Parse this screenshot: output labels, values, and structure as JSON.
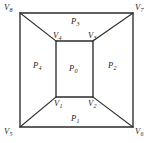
{
  "figure": {
    "type": "planar-graph-diagram",
    "stroke_color": "#2b2b2b",
    "text_color": "#1c1c1c",
    "background_color": "#ffffff",
    "vertices": [
      {
        "id": "v1",
        "base": "V",
        "sub": "1",
        "label": "V1",
        "ring": "inner",
        "corner": "bottom-left",
        "x": 56,
        "y": 97
      },
      {
        "id": "v2",
        "base": "V",
        "sub": "2",
        "label": "V2",
        "ring": "inner",
        "corner": "bottom-right",
        "x": 93,
        "y": 97
      },
      {
        "id": "v3",
        "base": "V",
        "sub": "3",
        "label": "V3",
        "ring": "inner",
        "corner": "top-right",
        "x": 93,
        "y": 41
      },
      {
        "id": "v4",
        "base": "V",
        "sub": "4",
        "label": "V4",
        "ring": "inner",
        "corner": "top-left",
        "x": 56,
        "y": 41
      },
      {
        "id": "v5",
        "base": "V",
        "sub": "5",
        "label": "V5",
        "ring": "outer",
        "corner": "bottom-left",
        "x": 20,
        "y": 127
      },
      {
        "id": "v6",
        "base": "V",
        "sub": "6",
        "label": "V6",
        "ring": "outer",
        "corner": "bottom-right",
        "x": 133,
        "y": 127
      },
      {
        "id": "v7",
        "base": "V",
        "sub": "7",
        "label": "V7",
        "ring": "outer",
        "corner": "top-right",
        "x": 133,
        "y": 13
      },
      {
        "id": "v8",
        "base": "V",
        "sub": "8",
        "label": "V8",
        "ring": "outer",
        "corner": "top-left",
        "x": 20,
        "y": 13
      }
    ],
    "faces": [
      {
        "id": "p0",
        "base": "P",
        "sub": "0",
        "label": "P0",
        "region": "center",
        "x": 74,
        "y": 69
      },
      {
        "id": "p1",
        "base": "P",
        "sub": "1",
        "label": "P1",
        "region": "bottom",
        "x": 76,
        "y": 119
      },
      {
        "id": "p2",
        "base": "P",
        "sub": "2",
        "label": "P2",
        "region": "right",
        "x": 113,
        "y": 66
      },
      {
        "id": "p3",
        "base": "P",
        "sub": "3",
        "label": "P3",
        "region": "top",
        "x": 76,
        "y": 22
      },
      {
        "id": "p4",
        "base": "P",
        "sub": "4",
        "label": "P4",
        "region": "left",
        "x": 38,
        "y": 66
      }
    ],
    "edges": [
      {
        "id": "outer-rect",
        "kind": "outer-boundary",
        "path": "V8-V7-V6-V5-V8"
      },
      {
        "id": "inner-rect",
        "kind": "inner-boundary",
        "path": "V4-V3-V2-V1-V4"
      },
      {
        "id": "diag-v8-v4",
        "kind": "diagonal",
        "from": "V8",
        "to": "V4"
      },
      {
        "id": "diag-v7-v3",
        "kind": "diagonal",
        "from": "V7",
        "to": "V3"
      },
      {
        "id": "diag-v6-v2",
        "kind": "diagonal",
        "from": "V6",
        "to": "V2"
      },
      {
        "id": "diag-v5-v1",
        "kind": "diagonal",
        "from": "V5",
        "to": "V1"
      }
    ]
  }
}
